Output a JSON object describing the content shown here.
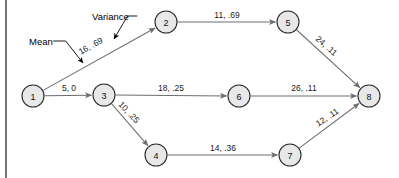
{
  "figure": {
    "background_color": "#ffffff",
    "node_fill": "#e8e8e8",
    "node_stroke": "#2b2b2b",
    "edge_color": "#6e6e72",
    "label_color": "#1a1a1a"
  },
  "nodes": [
    {
      "id": "1",
      "label": "1",
      "x": 33,
      "y": 96,
      "r": 11
    },
    {
      "id": "2",
      "label": "2",
      "x": 166,
      "y": 22,
      "r": 11
    },
    {
      "id": "3",
      "label": "3",
      "x": 104,
      "y": 95,
      "r": 11
    },
    {
      "id": "4",
      "label": "4",
      "x": 156,
      "y": 155,
      "r": 11
    },
    {
      "id": "5",
      "label": "5",
      "x": 288,
      "y": 22,
      "r": 11
    },
    {
      "id": "6",
      "label": "6",
      "x": 239,
      "y": 96,
      "r": 11
    },
    {
      "id": "7",
      "label": "7",
      "x": 290,
      "y": 155,
      "r": 11
    },
    {
      "id": "8",
      "label": "8",
      "x": 369,
      "y": 96,
      "r": 11
    }
  ],
  "edges": [
    {
      "from": "1",
      "to": "2",
      "label": "16, .69",
      "mean": 16,
      "variance": 0.69,
      "label_x": 94,
      "label_y": 52,
      "label_rotate": -29,
      "label_offset": -7
    },
    {
      "from": "1",
      "to": "3",
      "label": "5, 0",
      "mean": 5,
      "variance": 0,
      "label_x": 69,
      "label_y": 88,
      "label_rotate": 0,
      "label_offset": 0
    },
    {
      "from": "2",
      "to": "5",
      "label": "11, .69",
      "mean": 11,
      "variance": 0.69,
      "label_x": 227,
      "label_y": 15,
      "label_rotate": 0,
      "label_offset": 0
    },
    {
      "from": "3",
      "to": "6",
      "label": "18, .25",
      "mean": 18,
      "variance": 0.25,
      "label_x": 171,
      "label_y": 88,
      "label_rotate": 0,
      "label_offset": 0
    },
    {
      "from": "3",
      "to": "4",
      "label": "10, .25",
      "mean": 10,
      "variance": 0.25,
      "label_x": 124,
      "label_y": 117,
      "label_rotate": 47,
      "label_offset": -7
    },
    {
      "from": "4",
      "to": "7",
      "label": "14, .36",
      "mean": 14,
      "variance": 0.36,
      "label_x": 223,
      "label_y": 148,
      "label_rotate": 0,
      "label_offset": 0
    },
    {
      "from": "5",
      "to": "8",
      "label": "24, .11",
      "mean": 24,
      "variance": 0.11,
      "label_x": 322,
      "label_y": 51,
      "label_rotate": 41,
      "label_offset": -7
    },
    {
      "from": "6",
      "to": "8",
      "label": "26, .11",
      "mean": 26,
      "variance": 0.11,
      "label_x": 304,
      "label_y": 88,
      "label_rotate": 0,
      "label_offset": 0
    },
    {
      "from": "7",
      "to": "8",
      "label": "12, .11",
      "mean": 12,
      "variance": 0.11,
      "label_x": 331,
      "label_y": 123,
      "label_rotate": -34,
      "label_offset": -7
    }
  ],
  "annotations": [
    {
      "id": "mean",
      "text": "Mean",
      "x": 29,
      "y": 41,
      "target_x": 83,
      "target_y": 63
    },
    {
      "id": "variance",
      "text": "Variance",
      "x": 92,
      "y": 16,
      "target_x": 114,
      "target_y": 39
    }
  ]
}
